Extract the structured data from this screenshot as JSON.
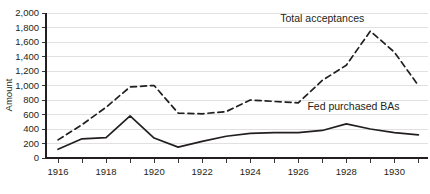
{
  "chart_data": {
    "type": "line",
    "title": "",
    "xlabel": "",
    "ylabel": "Amount",
    "xlim": [
      1915.5,
      1931.4
    ],
    "ylim": [
      0,
      2000
    ],
    "grid": true,
    "legend_position": "inline-annotations",
    "x": [
      1916,
      1917,
      1918,
      1919,
      1920,
      1921,
      1922,
      1923,
      1924,
      1925,
      1926,
      1927,
      1928,
      1929,
      1930,
      1931
    ],
    "y_ticks": [
      0,
      200,
      400,
      600,
      800,
      1000,
      1200,
      1400,
      1600,
      1800,
      2000
    ],
    "y_tick_labels": [
      "0",
      "200",
      "400",
      "600",
      "800",
      "1,000",
      "1,200",
      "1,400",
      "1,600",
      "1,800",
      "2,000"
    ],
    "x_ticks": [
      1916,
      1917,
      1918,
      1919,
      1920,
      1921,
      1922,
      1923,
      1924,
      1925,
      1926,
      1927,
      1928,
      1929,
      1930,
      1931
    ],
    "x_tick_labels_shown": [
      "1916",
      "1918",
      "1920",
      "1922",
      "1924",
      "1926",
      "1928",
      "1930"
    ],
    "series": [
      {
        "name": "Total acceptances",
        "style": "dashed",
        "color": "#231f20",
        "values": [
          250,
          460,
          700,
          980,
          1000,
          620,
          610,
          640,
          800,
          780,
          760,
          1070,
          1280,
          1750,
          1460,
          1000
        ]
      },
      {
        "name": "Fed purchased BAs",
        "style": "solid",
        "color": "#231f20",
        "values": [
          120,
          265,
          280,
          580,
          275,
          150,
          230,
          300,
          340,
          350,
          350,
          380,
          470,
          400,
          350,
          320
        ]
      }
    ],
    "annotations": [
      {
        "text": "Total acceptances",
        "x": 1927.0,
        "y": 1880
      },
      {
        "text": "Fed purchased BAs",
        "x": 1928.3,
        "y": 660
      }
    ]
  }
}
